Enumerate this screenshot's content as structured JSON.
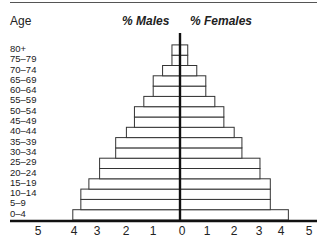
{
  "chart_data": {
    "type": "bar",
    "subtype": "population-pyramid",
    "title": "",
    "ylabel": "Age",
    "xlabel": "",
    "categories": [
      "0–4",
      "5–9",
      "10–14",
      "15–19",
      "20–24",
      "25–29",
      "30–34",
      "35–39",
      "40–44",
      "45–49",
      "50–54",
      "55–59",
      "60–64",
      "65–69",
      "70–74",
      "75–79",
      "80+"
    ],
    "series": [
      {
        "name": "% Males",
        "side": "left",
        "values": [
          4.0,
          3.7,
          3.7,
          3.4,
          3.0,
          3.0,
          2.4,
          2.4,
          2.0,
          1.7,
          1.7,
          1.35,
          1.0,
          1.0,
          0.65,
          0.3,
          0.3
        ]
      },
      {
        "name": "% Females",
        "side": "right",
        "values": [
          4.2,
          3.5,
          3.5,
          3.5,
          3.1,
          3.1,
          2.4,
          2.4,
          2.1,
          1.7,
          1.7,
          1.35,
          1.0,
          1.0,
          0.65,
          0.3,
          0.3
        ]
      }
    ],
    "xlim": [
      -5,
      5
    ],
    "xticks": [
      "5",
      "4",
      "3",
      "2",
      "1",
      "0",
      "1",
      "2",
      "3",
      "4",
      "5"
    ],
    "grid": false,
    "legend": "column headers above plot"
  },
  "labels": {
    "age_title": "Age",
    "males_header": "% Males",
    "females_header": "% Females",
    "age_groups_top_down": [
      "80+",
      "75–79",
      "70–74",
      "65–69",
      "60–64",
      "55–59",
      "50–54",
      "45–49",
      "40–44",
      "35–39",
      "30–34",
      "25–29",
      "20–24",
      "15–19",
      "10–14",
      "5–9",
      "0–4"
    ],
    "ticks_left": [
      "5",
      "4",
      "3",
      "2",
      "1"
    ],
    "tick_zero": "0",
    "ticks_right": [
      "1",
      "2",
      "3",
      "4",
      "5"
    ]
  },
  "colors": {
    "bar_fill": "#ffffff",
    "bar_stroke": "#333333",
    "axis": "#111111"
  }
}
